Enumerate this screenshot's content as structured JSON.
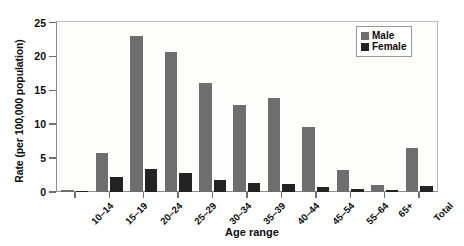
{
  "chart_data": {
    "type": "bar",
    "title": "",
    "xlabel": "Age range",
    "ylabel": "Rate (per 100,000 population)",
    "categories": [
      "10–14",
      "15–19",
      "20–24",
      "25–29",
      "30–34",
      "35–39",
      "40–44",
      "45–54",
      "55–64",
      "65+",
      "Total"
    ],
    "series": [
      {
        "name": "Male",
        "color": "#6e6e6e",
        "values": [
          0.3,
          5.8,
          23.0,
          20.7,
          16.1,
          12.8,
          13.9,
          9.6,
          3.2,
          1.0,
          6.5
        ]
      },
      {
        "name": "Female",
        "color": "#232323",
        "values": [
          0.2,
          2.2,
          3.4,
          2.8,
          1.8,
          1.3,
          1.2,
          0.8,
          0.4,
          0.3,
          0.9
        ]
      }
    ],
    "ylim": [
      0,
      25
    ],
    "yticks": [
      0,
      5,
      10,
      15,
      20,
      25
    ],
    "ytick_labels": [
      "0",
      "5",
      "10",
      "15",
      "20",
      "25"
    ],
    "grid": false,
    "legend_position": "top-right"
  }
}
